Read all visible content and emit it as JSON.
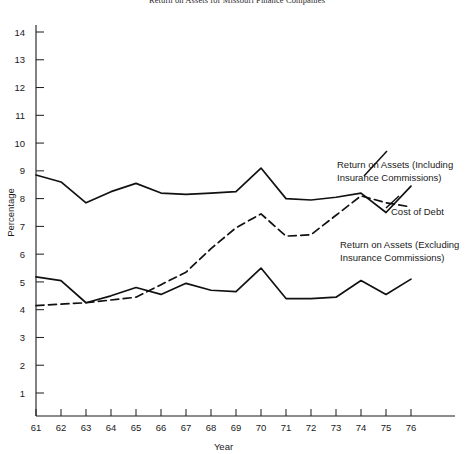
{
  "chart_data": {
    "type": "line",
    "title": "Return on Assets for Missouri Finance Companies",
    "xlabel": "Year",
    "ylabel": "Percentage",
    "x": [
      61,
      62,
      63,
      64,
      65,
      66,
      67,
      68,
      69,
      70,
      71,
      72,
      73,
      74,
      75,
      76
    ],
    "categories": [
      "61",
      "62",
      "63",
      "64",
      "65",
      "66",
      "67",
      "68",
      "69",
      "70",
      "71",
      "72",
      "73",
      "74",
      "75",
      "76"
    ],
    "xlim": [
      61,
      76
    ],
    "ylim": [
      0,
      14.6
    ],
    "yticks": [
      1,
      2,
      3,
      4,
      5,
      6,
      7,
      8,
      9,
      10,
      11,
      12,
      13,
      14
    ],
    "ytick_labels": [
      "1",
      "2",
      "3",
      "4",
      "5",
      "6",
      "7",
      "8",
      "9",
      "10",
      "11",
      "12",
      "13",
      "14"
    ],
    "xticks": [
      61,
      62,
      63,
      64,
      65,
      66,
      67,
      68,
      69,
      70,
      71,
      72,
      73,
      74,
      75,
      76
    ],
    "grid": false,
    "legend": "inline-annotations",
    "series": [
      {
        "name": "Return on Assets (Including Insurance Commissions)",
        "style": "solid",
        "color": "#111111",
        "values": [
          8.85,
          8.6,
          7.85,
          8.25,
          8.55,
          8.2,
          8.15,
          8.2,
          8.25,
          9.1,
          8.0,
          7.95,
          8.05,
          8.2,
          7.5,
          8.45
        ]
      },
      {
        "name": "Cost of Debt",
        "style": "dashed",
        "color": "#111111",
        "values": [
          4.15,
          4.2,
          4.25,
          4.35,
          4.45,
          4.9,
          5.35,
          6.2,
          6.95,
          7.45,
          6.65,
          6.7,
          7.4,
          8.1,
          7.85,
          7.7
        ]
      },
      {
        "name": "Return on Assets (Excluding Insurance Commissions)",
        "style": "solid",
        "color": "#111111",
        "values": [
          5.18,
          5.05,
          4.25,
          4.5,
          4.8,
          4.55,
          4.95,
          4.7,
          4.65,
          5.5,
          4.4,
          4.4,
          4.45,
          5.05,
          4.55,
          5.1
        ]
      }
    ],
    "annotations": [
      {
        "name": "return-on-assets-including-label",
        "lines": [
          "Return on Assets (Including",
          "Insurance Commissions)"
        ],
        "x": 337,
        "y": 168
      },
      {
        "name": "cost-of-debt-label",
        "lines": [
          "Cost of Debt"
        ],
        "x": 391,
        "y": 215
      },
      {
        "name": "return-on-assets-excluding-label",
        "lines": [
          "Return on Assets (Excluding",
          "Insurance Commissions)"
        ],
        "x": 340,
        "y": 248
      }
    ]
  }
}
